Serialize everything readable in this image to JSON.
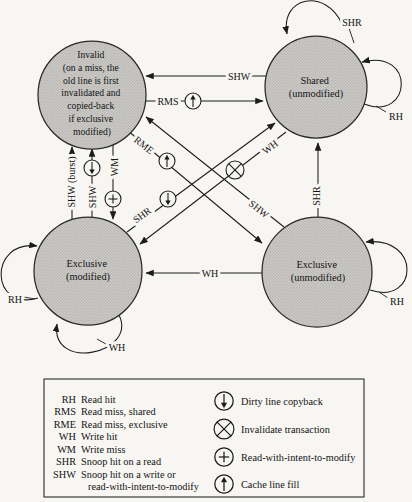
{
  "diagram": {
    "colors": {
      "ink": "#1c1c1c",
      "node_fill": "#c9c8c5",
      "background": "#f7f6f2"
    },
    "states": {
      "invalid": {
        "lines": [
          "Invalid",
          "(on a miss, the",
          "old line is first",
          "invalidated and",
          "copied-back",
          "if exclusive",
          "modified)"
        ]
      },
      "shared": {
        "lines": [
          "Shared",
          "(unmodified)"
        ]
      },
      "exclusive_modified": {
        "lines": [
          "Exclusive",
          "(modified)"
        ]
      },
      "exclusive_unmodified": {
        "lines": [
          "Exclusive",
          "(unmodified)"
        ]
      }
    },
    "edges": {
      "shw_shared_to_invalid": "SHW",
      "rms_invalid_to_shared": "RMS",
      "rme_invalid_to_exclusive_unmodified": "RME",
      "wh_shared_to_exclusive_modified": "WH",
      "shr_exclusive_modified_to_shared": "SHR",
      "shw_exclusive_unmodified_to_invalid": "SHW",
      "wm_invalid_to_exclusive_modified": "WM",
      "shw_exclusive_modified_to_invalid": "SHW",
      "shw_burst_exclusive_modified_to_invalid": "SHW (burst)",
      "shr_exclusive_unmodified_to_shared": "SHR",
      "wh_exclusive_unmodified_to_exclusive_modified": "WH",
      "loop_shared_shr": "SHR",
      "loop_shared_rh": "RH",
      "loop_exclusive_modified_rh": "RH",
      "loop_exclusive_modified_wh": "WH",
      "loop_exclusive_unmodified_rh": "RH"
    },
    "legend": {
      "abbreviations": [
        {
          "abbr": "RH",
          "meaning": "Read hit"
        },
        {
          "abbr": "RMS",
          "meaning": "Read miss, shared"
        },
        {
          "abbr": "RME",
          "meaning": "Read miss, exclusive"
        },
        {
          "abbr": "WH",
          "meaning": "Write hit"
        },
        {
          "abbr": "WM",
          "meaning": "Write miss"
        },
        {
          "abbr": "SHR",
          "meaning": "Snoop hit on a read"
        },
        {
          "abbr": "SHW",
          "meaning": "Snoop hit on a write or",
          "meaning2": "read-with-intent-to-modify"
        }
      ],
      "symbols": [
        {
          "icon": "circled-down-arrow",
          "meaning": "Dirty line copyback"
        },
        {
          "icon": "circled-x",
          "meaning": "Invalidate transaction"
        },
        {
          "icon": "circled-plus",
          "meaning": "Read-with-intent-to-modify"
        },
        {
          "icon": "circled-up-arrow",
          "meaning": "Cache line fill"
        }
      ]
    }
  }
}
